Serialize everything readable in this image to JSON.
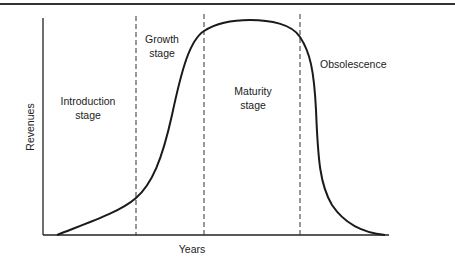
{
  "diagram": {
    "type": "product-life-cycle",
    "axes": {
      "x_label": "Years",
      "y_label": "Revenues"
    },
    "stages": [
      {
        "id": "introduction",
        "line1": "Introduction",
        "line2": "stage"
      },
      {
        "id": "growth",
        "line1": "Growth",
        "line2": "stage"
      },
      {
        "id": "maturity",
        "line1": "Maturity",
        "line2": "stage"
      },
      {
        "id": "obsolescence",
        "line1": "Obsolescence",
        "line2": ""
      }
    ],
    "stage_dividers": 3,
    "colors": {
      "line": "#1a1a1a",
      "background": "#ffffff",
      "text": "#222222"
    }
  }
}
